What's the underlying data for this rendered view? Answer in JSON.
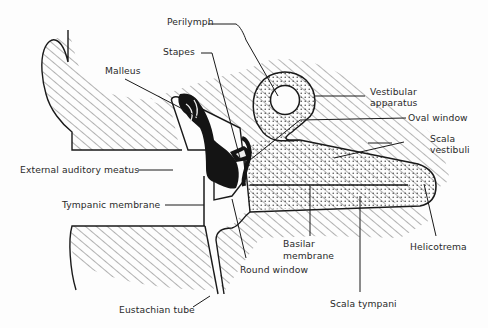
{
  "diagram": {
    "colors": {
      "line": "#1a1a1a",
      "fill_dark": "#141414",
      "hatch": "#555555",
      "stipple": "#333333",
      "background": "#fdfdfd"
    },
    "labels": {
      "perilymph": "Perilymph",
      "stapes": "Stapes",
      "malleus": "Malleus",
      "vestibular_apparatus_1": "Vestibular",
      "vestibular_apparatus_2": "apparatus",
      "oval_window": "Oval window",
      "scala_vestibuli_1": "Scala",
      "scala_vestibuli_2": "vestibuli",
      "external_auditory_meatus": "External auditory meatus",
      "tympanic_membrane": "Tympanic membrane",
      "basilar_membrane_1": "Basilar",
      "basilar_membrane_2": "membrane",
      "helicotrema": "Helicotrema",
      "round_window": "Round window",
      "eustachian_tube": "Eustachian tube",
      "scala_tympani": "Scala tympani"
    }
  }
}
